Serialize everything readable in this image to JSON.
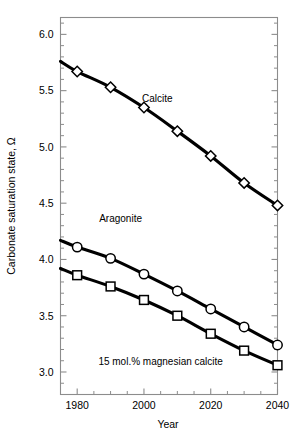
{
  "chart_data": {
    "type": "line",
    "title": "",
    "subtitle": "",
    "xlabel": "Year",
    "ylabel": "Carbonate saturation state, Ω",
    "xlim": [
      1975,
      2040
    ],
    "ylim": [
      2.8,
      6.15
    ],
    "grid": false,
    "legend_position": "inline-annotations",
    "x_ticks_major": [
      1980,
      2000,
      2020,
      2040
    ],
    "x_tick_labels": [
      "1980",
      "2000",
      "2020",
      "2040"
    ],
    "x_ticks_minor": [
      1985,
      1990,
      1995,
      2005,
      2010,
      2015,
      2025,
      2030,
      2035
    ],
    "y_ticks_major": [
      3.0,
      3.5,
      4.0,
      4.5,
      5.0,
      5.5,
      6.0
    ],
    "y_tick_labels": [
      "3.0",
      "3.5",
      "4.0",
      "4.5",
      "5.0",
      "5.5",
      "6.0"
    ],
    "y_ticks_minor": [
      2.9,
      3.1,
      3.2,
      3.3,
      3.4,
      3.6,
      3.7,
      3.8,
      3.9,
      4.1,
      4.2,
      4.3,
      4.4,
      4.6,
      4.7,
      4.8,
      4.9,
      5.1,
      5.2,
      5.3,
      5.4,
      5.6,
      5.7,
      5.8,
      5.9,
      6.1
    ],
    "x": [
      1975,
      1980,
      1990,
      2000,
      2010,
      2020,
      2030,
      2040
    ],
    "series": [
      {
        "name": "Calcite",
        "marker": "diamond",
        "values": [
          5.76,
          5.67,
          5.53,
          5.35,
          5.14,
          4.92,
          4.68,
          4.48
        ]
      },
      {
        "name": "Aragonite",
        "marker": "circle",
        "values": [
          4.17,
          4.11,
          4.01,
          3.87,
          3.72,
          3.56,
          3.4,
          3.24
        ]
      },
      {
        "name": "15 mol.% magnesian calcite",
        "marker": "square",
        "values": [
          3.92,
          3.86,
          3.76,
          3.64,
          3.5,
          3.34,
          3.19,
          3.06
        ]
      }
    ],
    "annotations": [
      {
        "text": "Calcite",
        "x": 2004,
        "y": 5.4
      },
      {
        "text": "Aragonite",
        "x": 1993,
        "y": 4.33
      },
      {
        "text": "15 mol.% magnesian calcite",
        "x": 2005,
        "y": 3.06
      }
    ]
  },
  "colors": {
    "line": "#000000",
    "marker_fill": "#ffffff",
    "axis": "#8c8c8c",
    "background": "#ffffff"
  }
}
